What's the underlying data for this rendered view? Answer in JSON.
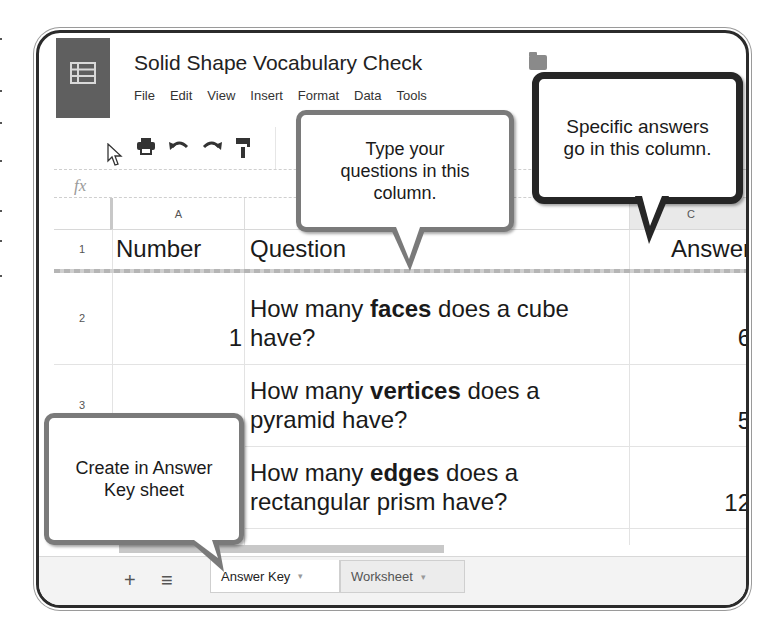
{
  "app": {
    "title": "Solid Shape Vocabulary Check",
    "logo_icon": "sheets-grid-icon",
    "folder_icon": "folder-icon"
  },
  "menu": {
    "items": [
      "File",
      "Edit",
      "View",
      "Insert",
      "Format",
      "Data",
      "Tools"
    ]
  },
  "toolbar": {
    "icons": [
      "print-icon",
      "undo-icon",
      "redo-icon",
      "paint-format-icon"
    ]
  },
  "formula_bar": {
    "label": "fx",
    "value": ""
  },
  "grid": {
    "columns": [
      "A",
      "B",
      "C"
    ],
    "rows": [
      {
        "num": "1",
        "number": "Number",
        "question_pre": "Question",
        "question_bold": "",
        "question_post": "",
        "answer": "Answer"
      },
      {
        "num": "2",
        "number": "1",
        "question_pre": "How many ",
        "question_bold": "faces",
        "question_post": " does a cube have?",
        "answer": "6"
      },
      {
        "num": "3",
        "number": "",
        "question_pre": "How many ",
        "question_bold": "vertices",
        "question_post": " does a pyramid have?",
        "answer": "5"
      },
      {
        "num": "4",
        "number": "",
        "question_pre": "How many ",
        "question_bold": "edges",
        "question_post": " does a rectangular prism have?",
        "answer": "12"
      }
    ]
  },
  "sheets": {
    "add_label": "+",
    "list_label": "≡",
    "tabs": [
      {
        "label": "Answer Key",
        "active": true,
        "caret": "▾"
      },
      {
        "label": "Worksheet",
        "active": false,
        "caret": "▾"
      }
    ]
  },
  "callouts": {
    "questions": "Type your questions in this column.",
    "answers": "Specific answers go in this column.",
    "answer_key": "Create in Answer Key sheet"
  },
  "colors": {
    "logo_bg": "#5f5f5f",
    "callout_gray_border": "#7a7a7a",
    "callout_dark_border": "#262626",
    "frame_border": "#2b2b2b"
  }
}
